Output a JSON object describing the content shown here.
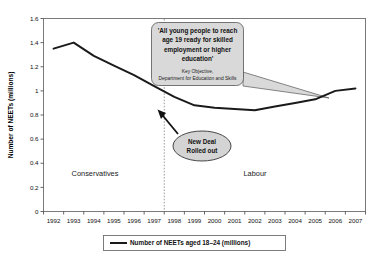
{
  "chart_data": {
    "type": "line",
    "title": "",
    "xlabel": "",
    "ylabel": "Number of NEETs (millions)",
    "ylim": [
      0,
      1.6
    ],
    "ytick_values": [
      0,
      0.2,
      0.4,
      0.6,
      0.8,
      1.0,
      1.2,
      1.4,
      1.6
    ],
    "ytick_labels": [
      "0",
      "0.2",
      "0.4",
      "0.6",
      "0.8",
      "1",
      "1.2",
      "1.4",
      "1.6"
    ],
    "categories": [
      "1992",
      "1993",
      "1994",
      "1995",
      "1996",
      "1997",
      "1998",
      "1999",
      "2000",
      "2001",
      "2002",
      "2003",
      "2004",
      "2005",
      "2006",
      "2007"
    ],
    "series": [
      {
        "name": "Number of NEETs aged 18–24 (millions)",
        "color": "#1a1a1a",
        "values": [
          1.35,
          1.4,
          1.29,
          1.21,
          1.13,
          1.04,
          0.95,
          0.88,
          0.86,
          0.85,
          0.84,
          0.87,
          0.9,
          0.93,
          1.0,
          1.02
        ]
      }
    ],
    "grid": false,
    "legend_position": "bottom"
  },
  "legend": {
    "entries": [
      {
        "label": "Number of NEETs aged 18–24 (millions)",
        "color": "#1a1a1a"
      }
    ]
  },
  "annotations": {
    "era_left": "Conservatives",
    "era_right": "Labour",
    "divider_year": "1997",
    "policy_callout": {
      "quote_lines": [
        "'All young people to reach",
        "age 19 ready for skilled",
        "employment or higher",
        "education'"
      ],
      "source_lines": [
        "Key Objective,",
        "Department for Education and Skills"
      ],
      "fill": "#d9d9d9",
      "stroke": "#555555"
    },
    "new_deal_bubble": {
      "lines": [
        "New Deal",
        "Rolled out"
      ],
      "fill": "#d4d4d4",
      "stroke": "#333333"
    }
  },
  "colors": {
    "line": "#1a1a1a",
    "frame": "#7a7a7a",
    "divider": "#999999",
    "background": "#ffffff"
  }
}
